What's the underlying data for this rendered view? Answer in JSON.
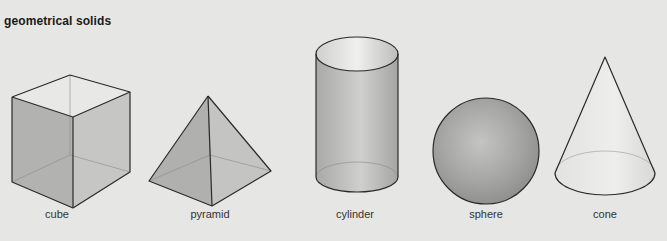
{
  "title": "geometrical solids",
  "colors": {
    "background": "#e6e6e4",
    "outline": "#2a2a2a",
    "fill_mid": "#b8b8b6",
    "fill_light": "#d6d6d4"
  },
  "solids": [
    {
      "name": "cube",
      "label": "cube",
      "label_x": 57
    },
    {
      "name": "pyramid",
      "label": "pyramid",
      "label_x": 210
    },
    {
      "name": "cylinder",
      "label": "cylinder",
      "label_x": 355
    },
    {
      "name": "sphere",
      "label": "sphere",
      "label_x": 486
    },
    {
      "name": "cone",
      "label": "cone",
      "label_x": 605
    }
  ]
}
